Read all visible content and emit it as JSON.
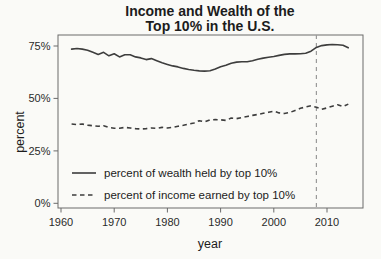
{
  "page": {
    "background": "#fafaf7",
    "line_color": "#3d3d3d",
    "reference_color": "#9a9a9a",
    "frame_color": "#6b6b6b"
  },
  "chart_data": {
    "type": "line",
    "title_line1": "Income and Wealth of the",
    "title_line2": "Top 10% in the U.S.",
    "xlabel": "year",
    "ylabel": "percent",
    "x_ticks": [
      1960,
      1970,
      1980,
      1990,
      2000,
      2010
    ],
    "x_tick_labels": [
      "1960",
      "1970",
      "1980",
      "1990",
      "2000",
      "2010"
    ],
    "y_ticks": [
      0,
      25,
      50,
      75
    ],
    "y_tick_labels": [
      "0%",
      "25%",
      "50%",
      "75%"
    ],
    "xlim": [
      1959.4,
      2016.7
    ],
    "ylim": [
      -2.5,
      80.5
    ],
    "grid": false,
    "legend_position": "inside-bottom-left",
    "reference_line": {
      "year": 2008,
      "style": "dashed",
      "color": "#9a9a9a"
    },
    "years": [
      1962,
      1963,
      1964,
      1965,
      1966,
      1967,
      1968,
      1969,
      1970,
      1971,
      1972,
      1973,
      1974,
      1975,
      1976,
      1977,
      1978,
      1979,
      1980,
      1981,
      1982,
      1983,
      1984,
      1985,
      1986,
      1987,
      1988,
      1989,
      1990,
      1991,
      1992,
      1993,
      1994,
      1995,
      1996,
      1997,
      1998,
      1999,
      2000,
      2001,
      2002,
      2003,
      2004,
      2005,
      2006,
      2007,
      2008,
      2009,
      2010,
      2011,
      2012,
      2013,
      2014
    ],
    "series": [
      {
        "name": "percent of wealth held by top 10%",
        "style": "solid",
        "color": "#3d3d3d",
        "values": [
          73.5,
          73.8,
          73.5,
          73.0,
          72.0,
          71.0,
          72.0,
          70.3,
          71.3,
          69.8,
          70.8,
          70.8,
          69.8,
          69.3,
          68.5,
          69.0,
          68.0,
          67.0,
          66.2,
          65.5,
          65.0,
          64.3,
          63.8,
          63.4,
          63.1,
          63.0,
          63.2,
          64.0,
          65.1,
          65.8,
          66.8,
          67.3,
          67.5,
          67.5,
          68.0,
          68.7,
          69.2,
          69.6,
          70.0,
          70.5,
          71.0,
          71.2,
          71.2,
          71.3,
          71.5,
          72.5,
          74.3,
          75.2,
          75.5,
          75.7,
          75.6,
          75.3,
          74.2
        ]
      },
      {
        "name": "percent of income earned by top 10%",
        "style": "dashed",
        "color": "#3d3d3d",
        "values": [
          37.8,
          37.5,
          37.8,
          37.3,
          37.0,
          36.7,
          37.0,
          36.2,
          35.8,
          35.8,
          36.2,
          35.9,
          35.6,
          35.4,
          35.6,
          35.9,
          35.7,
          36.2,
          35.9,
          36.2,
          36.7,
          37.2,
          37.8,
          38.3,
          39.4,
          38.8,
          39.8,
          39.9,
          39.8,
          39.5,
          40.6,
          40.4,
          40.9,
          41.4,
          41.9,
          42.4,
          42.9,
          43.4,
          43.9,
          43.1,
          42.8,
          43.3,
          44.3,
          45.3,
          45.9,
          46.5,
          45.8,
          44.8,
          45.5,
          46.3,
          47.0,
          46.1,
          47.3
        ]
      }
    ]
  }
}
